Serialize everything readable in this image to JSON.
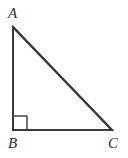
{
  "figure": {
    "type": "right-triangle",
    "canvas": {
      "width": 128,
      "height": 158,
      "background": "#ffffff"
    },
    "stroke": {
      "color": "#3a3a3a",
      "width": 2
    },
    "right_angle_marker": {
      "at_vertex": "B",
      "size": 14,
      "color": "#4a4a4a",
      "width": 1.5
    },
    "vertices": [
      {
        "name": "A",
        "label": "A",
        "x": 13,
        "y": 27,
        "angle_marked": false
      },
      {
        "name": "B",
        "label": "B",
        "x": 13,
        "y": 130,
        "angle_marked": true
      },
      {
        "name": "C",
        "label": "C",
        "x": 112,
        "y": 130,
        "angle_marked": false
      }
    ],
    "sides": [
      {
        "name": "AB",
        "from": "A",
        "to": "B",
        "role": "leg"
      },
      {
        "name": "BC",
        "from": "B",
        "to": "C",
        "role": "leg"
      },
      {
        "name": "AC",
        "from": "A",
        "to": "C",
        "role": "hypotenuse"
      }
    ],
    "labels": {
      "A": "A",
      "B": "B",
      "C": "C"
    }
  }
}
